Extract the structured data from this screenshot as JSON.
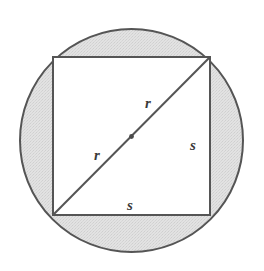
{
  "figure": {
    "background_color": "#ffffff",
    "stroke_color": "#555555",
    "shaded_region_color": "#dcdcdc",
    "label_color": "#3a3a3a",
    "circle": {
      "name": "circumscribed-circle",
      "center_x": 131.5,
      "center_y": 140.5,
      "radius": 111.5,
      "stroke_width": 2.0,
      "fill": "#dcdcdc"
    },
    "square": {
      "name": "inscribed-square",
      "left": 53,
      "top": 57,
      "right": 210,
      "bottom": 215,
      "side_length": 158,
      "stroke_width": 2.0,
      "fill": "#ffffff"
    },
    "diagonal": {
      "name": "diameter-diagonal",
      "x1": 53,
      "y1": 215,
      "x2": 210,
      "y2": 57,
      "stroke_width": 2.0
    },
    "center_dot": {
      "name": "circle-center-dot",
      "cx": 131.5,
      "cy": 136.5,
      "radius": 2.4
    },
    "labels": [
      {
        "id": "radius-upper",
        "text": "r",
        "x": 148,
        "y": 108
      },
      {
        "id": "radius-lower",
        "text": "r",
        "x": 97,
        "y": 160
      },
      {
        "id": "side-right",
        "text": "s",
        "x": 193,
        "y": 150
      },
      {
        "id": "side-bottom",
        "text": "s",
        "x": 130,
        "y": 210
      }
    ]
  }
}
